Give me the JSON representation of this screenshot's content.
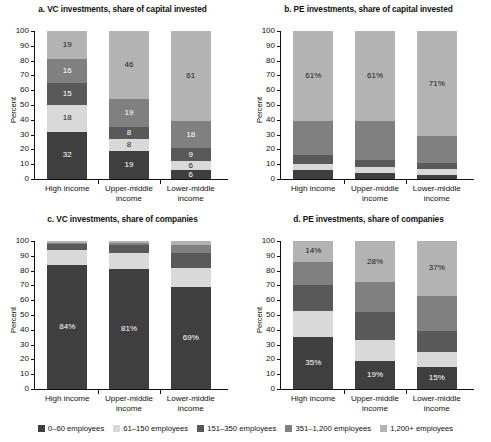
{
  "figure": {
    "ylabel": "Percent",
    "y_ticks": [
      "0",
      "10",
      "20",
      "30",
      "40",
      "50",
      "60",
      "70",
      "80",
      "90",
      "100"
    ],
    "categories": [
      "High income",
      "Upper-middle income",
      "Lower-middle income"
    ],
    "category_lines": [
      [
        "High income"
      ],
      [
        "Upper-middle",
        "income"
      ],
      [
        "Lower-middle",
        "income"
      ]
    ]
  },
  "legend": {
    "items": [
      {
        "label": "0–60 employees",
        "color": "#3f3f3f"
      },
      {
        "label": "61–150 employees",
        "color": "#d9d9d9"
      },
      {
        "label": "151–350 employees",
        "color": "#595959"
      },
      {
        "label": "351–1,200 employees",
        "color": "#808080"
      },
      {
        "label": "1,200+ employees",
        "color": "#b3b3b3"
      }
    ]
  },
  "chart_data": [
    {
      "id": "a",
      "type": "bar",
      "title": "a. VC investments, share of capital invested",
      "xlabel": "",
      "ylabel": "Percent",
      "ylim": [
        0,
        100
      ],
      "grid": false,
      "stacked": true,
      "legend_position": "bottom",
      "categories": [
        "High income",
        "Upper-middle income",
        "Lower-middle income"
      ],
      "series": [
        {
          "name": "0–60 employees",
          "color": "#3f3f3f",
          "values": [
            32,
            19,
            6
          ],
          "labels": [
            "32",
            "19",
            "6"
          ]
        },
        {
          "name": "61–150 employees",
          "color": "#d9d9d9",
          "values": [
            18,
            8,
            6
          ],
          "labels": [
            "18",
            "8",
            "6"
          ]
        },
        {
          "name": "151–350 employees",
          "color": "#595959",
          "values": [
            15,
            8,
            9
          ],
          "labels": [
            "15",
            "8",
            "9"
          ]
        },
        {
          "name": "351–1,200 employees",
          "color": "#808080",
          "values": [
            16,
            19,
            18
          ],
          "labels": [
            "16",
            "19",
            "18"
          ]
        },
        {
          "name": "1,200+ employees",
          "color": "#b3b3b3",
          "values": [
            19,
            46,
            61
          ],
          "labels": [
            "19",
            "46",
            "61"
          ]
        }
      ]
    },
    {
      "id": "b",
      "type": "bar",
      "title": "b. PE investments, share of capital invested",
      "xlabel": "",
      "ylabel": "Percent",
      "ylim": [
        0,
        100
      ],
      "grid": false,
      "stacked": true,
      "legend_position": "bottom",
      "categories": [
        "High income",
        "Upper-middle income",
        "Lower-middle income"
      ],
      "series": [
        {
          "name": "0–60 employees",
          "color": "#3f3f3f",
          "values": [
            6,
            4,
            3
          ],
          "labels": [
            "",
            "",
            ""
          ]
        },
        {
          "name": "61–150 employees",
          "color": "#d9d9d9",
          "values": [
            4,
            4,
            4
          ],
          "labels": [
            "",
            "",
            ""
          ]
        },
        {
          "name": "151–350 employees",
          "color": "#595959",
          "values": [
            6,
            5,
            4
          ],
          "labels": [
            "",
            "",
            ""
          ]
        },
        {
          "name": "351–1,200 employees",
          "color": "#808080",
          "values": [
            23,
            26,
            18
          ],
          "labels": [
            "",
            "",
            ""
          ]
        },
        {
          "name": "1,200+ employees",
          "color": "#b3b3b3",
          "values": [
            61,
            61,
            71
          ],
          "labels": [
            "61%",
            "61%",
            "71%"
          ]
        }
      ]
    },
    {
      "id": "c",
      "type": "bar",
      "title": "c. VC investments, share of companies",
      "xlabel": "",
      "ylabel": "Percent",
      "ylim": [
        0,
        100
      ],
      "grid": false,
      "stacked": true,
      "legend_position": "bottom",
      "categories": [
        "High income",
        "Upper-middle income",
        "Lower-middle income"
      ],
      "series": [
        {
          "name": "0–60 employees",
          "color": "#3f3f3f",
          "values": [
            84,
            81,
            69
          ],
          "labels": [
            "84%",
            "81%",
            "69%"
          ]
        },
        {
          "name": "61–150 employees",
          "color": "#d9d9d9",
          "values": [
            10,
            11,
            13
          ],
          "labels": [
            "",
            "",
            ""
          ]
        },
        {
          "name": "151–350 employees",
          "color": "#595959",
          "values": [
            4,
            5,
            10
          ],
          "labels": [
            "",
            "",
            ""
          ]
        },
        {
          "name": "351–1,200 employees",
          "color": "#808080",
          "values": [
            1,
            2,
            5
          ],
          "labels": [
            "",
            "",
            ""
          ]
        },
        {
          "name": "1,200+ employees",
          "color": "#b3b3b3",
          "values": [
            1,
            1,
            3
          ],
          "labels": [
            "",
            "",
            ""
          ]
        }
      ]
    },
    {
      "id": "d",
      "type": "bar",
      "title": "d. PE investments, share of companies",
      "xlabel": "",
      "ylabel": "Percent",
      "ylim": [
        0,
        100
      ],
      "grid": false,
      "stacked": true,
      "legend_position": "bottom",
      "categories": [
        "High income",
        "Upper-middle incomc",
        "Lower-middle income"
      ],
      "series": [
        {
          "name": "0–60 employees",
          "color": "#3f3f3f",
          "values": [
            35,
            19,
            15
          ],
          "labels": [
            "35%",
            "19%",
            "15%"
          ]
        },
        {
          "name": "61–150 employees",
          "color": "#d9d9d9",
          "values": [
            18,
            14,
            10
          ],
          "labels": [
            "",
            "",
            ""
          ]
        },
        {
          "name": "151–350 employees",
          "color": "#595959",
          "values": [
            17,
            19,
            14
          ],
          "labels": [
            "",
            "",
            ""
          ]
        },
        {
          "name": "351–1,200 employees",
          "color": "#808080",
          "values": [
            16,
            20,
            24
          ],
          "labels": [
            "",
            "",
            ""
          ]
        },
        {
          "name": "1,200+ employees",
          "color": "#b3b3b3",
          "values": [
            14,
            28,
            37
          ],
          "labels": [
            "14%",
            "28%",
            "37%"
          ]
        }
      ]
    }
  ]
}
